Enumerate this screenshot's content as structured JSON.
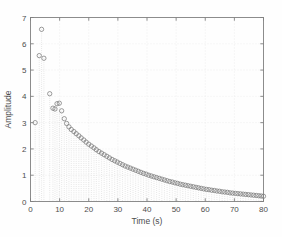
{
  "figure": {
    "background": "#ffffff",
    "axes_color": "#808080",
    "grid_color": "#e6e6e6",
    "marker_color": "#7a7a7a",
    "stem_color": "#c9c9c9",
    "caption": ""
  },
  "chart_data": {
    "type": "scatter",
    "title": "",
    "xlabel": "Time (s)",
    "ylabel": "Amplitude",
    "xlim": [
      0,
      80
    ],
    "ylim": [
      0,
      7
    ],
    "xticks": [
      0,
      10,
      20,
      30,
      40,
      50,
      60,
      70,
      80
    ],
    "xticklabels": [
      "0",
      "10",
      "20",
      "30",
      "40",
      "50",
      "60",
      "70",
      "80"
    ],
    "yticks": [
      0,
      1,
      2,
      3,
      4,
      5,
      6,
      7
    ],
    "yticklabels": [
      "0",
      "1",
      "2",
      "3",
      "4",
      "5",
      "6",
      "7"
    ],
    "grid": true,
    "grid_style": "dotted",
    "legend": null,
    "marker": "open-circle",
    "marker_size": 3,
    "stems": true,
    "series": [
      {
        "name": "amplitude",
        "x": [
          1.6,
          3.0,
          3.8,
          4.6,
          6.6,
          7.7,
          8.4,
          9.1,
          9.9,
          10.7,
          11.6,
          12.4,
          13.2,
          14.0,
          14.9,
          15.7,
          16.6,
          17.4,
          18.3,
          19.1,
          20.0,
          20.9,
          21.8,
          22.6,
          23.5,
          24.4,
          25.3,
          26.2,
          27.1,
          28.0,
          28.9,
          29.8,
          30.7,
          31.6,
          32.5,
          33.4,
          34.3,
          35.2,
          36.1,
          37.0,
          37.9,
          38.8,
          39.7,
          40.6,
          41.5,
          42.4,
          43.3,
          44.2,
          45.1,
          46.0,
          46.9,
          47.8,
          48.7,
          49.6,
          50.5,
          51.4,
          52.3,
          53.2,
          54.1,
          55.0,
          55.9,
          56.8,
          57.7,
          58.6,
          59.5,
          60.4,
          61.3,
          62.2,
          63.1,
          64.0,
          64.9,
          65.8,
          66.7,
          67.6,
          68.5,
          69.4,
          70.3,
          71.2,
          72.1,
          73.0,
          73.9,
          74.8,
          75.7,
          76.6,
          77.5,
          78.4,
          79.2,
          80.0
        ],
        "y": [
          3.0,
          5.55,
          6.55,
          5.45,
          4.1,
          3.55,
          3.52,
          3.72,
          3.74,
          3.45,
          3.15,
          2.97,
          2.84,
          2.74,
          2.66,
          2.58,
          2.5,
          2.42,
          2.34,
          2.26,
          2.18,
          2.11,
          2.04,
          1.97,
          1.9,
          1.84,
          1.78,
          1.72,
          1.66,
          1.6,
          1.55,
          1.5,
          1.45,
          1.4,
          1.35,
          1.31,
          1.27,
          1.23,
          1.19,
          1.15,
          1.11,
          1.07,
          1.04,
          1.0,
          0.97,
          0.94,
          0.91,
          0.88,
          0.85,
          0.82,
          0.79,
          0.76,
          0.74,
          0.71,
          0.69,
          0.66,
          0.64,
          0.62,
          0.6,
          0.58,
          0.56,
          0.54,
          0.52,
          0.5,
          0.48,
          0.46,
          0.45,
          0.43,
          0.42,
          0.4,
          0.39,
          0.37,
          0.36,
          0.35,
          0.33,
          0.32,
          0.31,
          0.3,
          0.29,
          0.28,
          0.27,
          0.26,
          0.25,
          0.24,
          0.23,
          0.22,
          0.21,
          0.2
        ]
      }
    ]
  }
}
